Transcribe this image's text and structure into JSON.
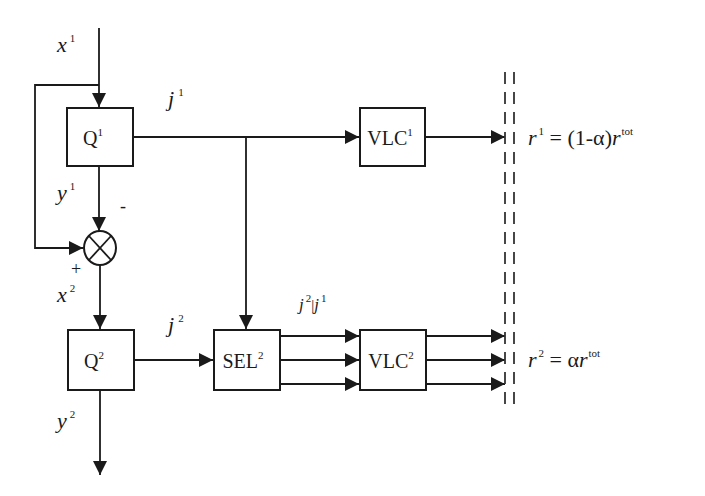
{
  "diagram": {
    "blocks": {
      "q1": {
        "label": "Q",
        "sup": "1"
      },
      "q2": {
        "label": "Q",
        "sup": "2"
      },
      "vlc1": {
        "label": "VLC",
        "sup": "1"
      },
      "sel2": {
        "label": "SEL",
        "sup": "2"
      },
      "vlc2": {
        "label": "VLC",
        "sup": "2"
      }
    },
    "signals": {
      "x1": {
        "label": "x",
        "sup": "1"
      },
      "y1": {
        "label": "y",
        "sup": "1"
      },
      "x2": {
        "label": "x",
        "sup": "2"
      },
      "y2": {
        "label": "y",
        "sup": "2"
      },
      "j1": {
        "label": "j",
        "sup": "1"
      },
      "j2": {
        "label": "j",
        "sup": "2"
      },
      "j2_given_j1": {
        "a": "j",
        "a_sup": "2",
        "bar": "|",
        "b": "j",
        "b_sup": "1"
      }
    },
    "summer": {
      "symbol": "⊗",
      "minus_sign": "-",
      "plus_sign": "+"
    },
    "rates": {
      "r1": {
        "r": "r",
        "r_sup": "1",
        "eq": " = (1-α)",
        "r2": "r",
        "r2_sup": "tot"
      },
      "r2": {
        "r": "r",
        "r_sup": "2",
        "eq": " = α",
        "r2": "r",
        "r2_sup": "tot"
      }
    },
    "colors": {
      "ink": "#1a1a1a",
      "background": "#ffffff"
    }
  }
}
